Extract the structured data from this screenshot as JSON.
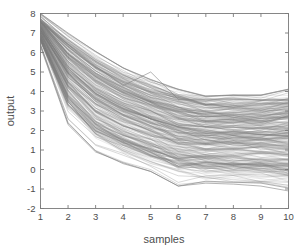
{
  "chart_data": {
    "type": "line",
    "title": "",
    "subtitle": "",
    "xlabel": "samples",
    "ylabel": "output",
    "xlim": [
      1,
      10
    ],
    "ylim": [
      -2,
      8
    ],
    "xticks": [
      1,
      2,
      3,
      4,
      5,
      6,
      7,
      8,
      9,
      10
    ],
    "yticks": [
      -2,
      -1,
      0,
      1,
      2,
      3,
      4,
      5,
      6,
      7,
      8
    ],
    "xtick_labels": [
      "1",
      "2",
      "3",
      "4",
      "5",
      "6",
      "7",
      "8",
      "9",
      "10"
    ],
    "ytick_labels": [
      "-2",
      "-1",
      "0",
      "1",
      "2",
      "3",
      "4",
      "5",
      "6",
      "7",
      "8"
    ],
    "grid": false,
    "legend": null,
    "legend_position": "none",
    "series_color": "#808080",
    "series_count": 300,
    "x": [
      1,
      2,
      3,
      4,
      5,
      6,
      7,
      8,
      9,
      10
    ],
    "envelope_upper": [
      8.0,
      7.0,
      6.05,
      5.2,
      4.6,
      4.1,
      3.75,
      3.8,
      3.8,
      4.1
    ],
    "envelope_lower": [
      6.3,
      2.3,
      0.9,
      0.35,
      -0.1,
      -0.85,
      -0.7,
      -0.75,
      -0.85,
      -1.1
    ],
    "band_core_upper": [
      7.7,
      6.7,
      5.7,
      4.9,
      4.35,
      3.9,
      3.6,
      3.6,
      3.6,
      3.7
    ],
    "band_core_lower": [
      6.6,
      3.4,
      1.7,
      0.9,
      0.4,
      0.05,
      -0.2,
      -0.3,
      -0.35,
      -0.5
    ],
    "median_trace": [
      7.2,
      5.2,
      3.9,
      3.1,
      2.6,
      2.2,
      1.95,
      1.85,
      1.8,
      1.75
    ],
    "annotations": [
      {
        "label": "upper outlier peak",
        "x": 5,
        "y": 5.0
      },
      {
        "label": "lower outlier trough",
        "x": 6,
        "y": -0.85
      }
    ],
    "series": [
      {
        "name": "trajectory-upper-envelope",
        "values": [
          8.0,
          7.0,
          6.05,
          5.2,
          4.6,
          4.1,
          3.75,
          3.8,
          3.8,
          4.1
        ]
      },
      {
        "name": "trajectory-lower-envelope",
        "values": [
          6.3,
          2.3,
          0.9,
          0.35,
          -0.1,
          -0.85,
          -0.7,
          -0.75,
          -0.85,
          -1.1
        ]
      },
      {
        "name": "trajectory-median",
        "values": [
          7.2,
          5.2,
          3.9,
          3.1,
          2.6,
          2.2,
          1.95,
          1.85,
          1.8,
          1.75
        ]
      },
      {
        "name": "trajectory-outlier-high",
        "values": [
          7.6,
          6.4,
          5.3,
          4.3,
          5.0,
          3.6,
          3.6,
          3.6,
          3.55,
          3.6
        ]
      },
      {
        "name": "trajectory-outlier-low",
        "values": [
          6.4,
          2.4,
          0.95,
          0.3,
          -0.1,
          -0.85,
          -0.6,
          -0.65,
          -0.7,
          -0.95
        ]
      }
    ]
  },
  "figure": {
    "background_color": "#ffffff",
    "axes_color": "#7a7a7a",
    "text_color": "#4d4d4d"
  }
}
